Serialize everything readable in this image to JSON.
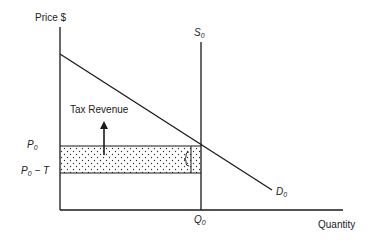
{
  "diagram": {
    "type": "tax-incidence-perfectly-inelastic-supply",
    "axes": {
      "y_label": "Price $",
      "x_label": "Quantity"
    },
    "curves": {
      "supply": {
        "label": "S",
        "subscript": "0",
        "kind": "vertical"
      },
      "demand": {
        "label": "D",
        "subscript": "0",
        "kind": "downward-sloping"
      }
    },
    "price_levels": [
      {
        "label": "P",
        "subscript": "0",
        "suffix": ""
      },
      {
        "label": "P",
        "subscript": "0",
        "suffix": " − T"
      }
    ],
    "quantity_levels": [
      {
        "label": "Q",
        "subscript": "0"
      }
    ],
    "annotations": {
      "tax_revenue": "Tax Revenue"
    },
    "colors": {
      "line": "#1a1a1a",
      "dots": "#333333",
      "background": "#ffffff"
    }
  }
}
